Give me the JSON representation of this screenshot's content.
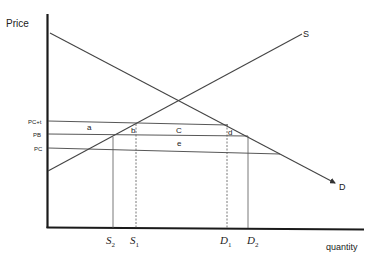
{
  "diagram": {
    "type": "supply-demand-tax",
    "axes": {
      "y_label": "Price",
      "x_label": "quantity"
    },
    "curves": {
      "supply_label": "S",
      "demand_label": "D"
    },
    "price_levels": [
      {
        "id": "pct",
        "label": "PC+t"
      },
      {
        "id": "pb",
        "label": "PB"
      },
      {
        "id": "pc",
        "label": "PC"
      }
    ],
    "areas": [
      {
        "id": "a",
        "label": "a"
      },
      {
        "id": "b",
        "label": "b"
      },
      {
        "id": "c",
        "label": "C"
      },
      {
        "id": "d",
        "label": "d"
      },
      {
        "id": "e",
        "label": "e"
      }
    ],
    "quantities": [
      {
        "id": "s2",
        "base": "S",
        "sub": "2"
      },
      {
        "id": "s1",
        "base": "S",
        "sub": "1"
      },
      {
        "id": "d1",
        "base": "D",
        "sub": "1"
      },
      {
        "id": "d2",
        "base": "D",
        "sub": "2"
      }
    ],
    "colors": {
      "axis": "#1a1a1a",
      "line": "#444444",
      "text": "#222222"
    }
  }
}
